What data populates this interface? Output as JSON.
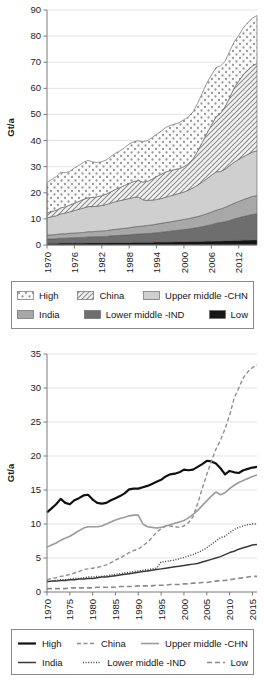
{
  "figure": {
    "panels": [
      {
        "id": "stacked-area-chart",
        "axis": {
          "ylabel": "Gt/a"
        }
      },
      {
        "id": "line-chart",
        "axis": {
          "ylabel": "Gt/a"
        }
      }
    ]
  },
  "legend_top": {
    "rows": [
      [
        {
          "label": "High",
          "pattern": "dots",
          "fill": "#fbfbfb"
        },
        {
          "label": "China",
          "pattern": "diagonal-hatch",
          "fill": "#f2f2f2"
        },
        {
          "label": "Upper middle -CHN",
          "pattern": "solid",
          "fill": "#cfcfcf"
        }
      ],
      [
        {
          "label": "India",
          "pattern": "solid",
          "fill": "#a8a8a8"
        },
        {
          "label": "Lower middle -IND",
          "pattern": "solid",
          "fill": "#6e6e6e"
        },
        {
          "label": "Low",
          "pattern": "solid",
          "fill": "#151515"
        }
      ]
    ]
  },
  "legend_bottom": {
    "rows": [
      [
        {
          "label": "High",
          "stroke": "#111111",
          "width": 2.2,
          "dash": "none"
        },
        {
          "label": "China",
          "stroke": "#8f8f8f",
          "width": 1.4,
          "dash": "4,2.5"
        },
        {
          "label": "Upper middle -CHN",
          "stroke": "#9b9b9b",
          "width": 1.6,
          "dash": "none"
        }
      ],
      [
        {
          "label": "India",
          "stroke": "#3a3a3a",
          "width": 1.5,
          "dash": "none"
        },
        {
          "label": "Lower middle -IND",
          "stroke": "#3f3f3f",
          "width": 1.4,
          "dash": "1,1.6"
        },
        {
          "label": "Low",
          "stroke": "#8a8a8a",
          "width": 1.6,
          "dash": "5,3"
        }
      ]
    ]
  },
  "chart_data": [
    {
      "type": "area",
      "title": "",
      "subtitle": "",
      "stacked": true,
      "xlabel": "",
      "ylabel": "Gt/a",
      "xlim": [
        1970,
        2016
      ],
      "ylim": [
        0,
        90
      ],
      "yticks": [
        0,
        10,
        20,
        30,
        40,
        50,
        60,
        70,
        80,
        90
      ],
      "xticks": [
        1970,
        1976,
        1982,
        1988,
        1994,
        2000,
        2006,
        2012
      ],
      "grid": true,
      "legend_position": "below",
      "x": [
        1970,
        1971,
        1972,
        1973,
        1974,
        1975,
        1976,
        1977,
        1978,
        1979,
        1980,
        1981,
        1982,
        1983,
        1984,
        1985,
        1986,
        1987,
        1988,
        1989,
        1990,
        1991,
        1992,
        1993,
        1994,
        1995,
        1996,
        1997,
        1998,
        1999,
        2000,
        2001,
        2002,
        2003,
        2004,
        2005,
        2006,
        2007,
        2008,
        2009,
        2010,
        2011,
        2012,
        2013,
        2014,
        2015,
        2016
      ],
      "series": [
        {
          "name": "Low",
          "fill": "#151515",
          "pattern": "solid",
          "values": [
            0.7,
            0.7,
            0.7,
            0.8,
            0.8,
            0.8,
            0.8,
            0.8,
            0.8,
            0.9,
            0.9,
            0.9,
            0.9,
            0.9,
            1.0,
            1.0,
            1.0,
            1.0,
            1.0,
            1.1,
            1.1,
            1.1,
            1.1,
            1.1,
            1.2,
            1.2,
            1.2,
            1.2,
            1.3,
            1.3,
            1.3,
            1.3,
            1.4,
            1.4,
            1.4,
            1.5,
            1.5,
            1.6,
            1.6,
            1.7,
            1.7,
            1.8,
            1.8,
            1.9,
            1.9,
            2.0,
            2.0
          ]
        },
        {
          "name": "Lower middle -IND",
          "fill": "#6e6e6e",
          "pattern": "solid",
          "values": [
            1.6,
            1.6,
            1.7,
            1.8,
            1.8,
            1.9,
            2.0,
            2.0,
            2.1,
            2.2,
            2.2,
            2.3,
            2.3,
            2.4,
            2.5,
            2.6,
            2.7,
            2.8,
            2.9,
            3.0,
            3.1,
            3.2,
            3.3,
            3.4,
            3.5,
            3.7,
            3.9,
            4.1,
            4.2,
            4.4,
            4.6,
            4.8,
            5.0,
            5.3,
            5.6,
            5.9,
            6.3,
            6.7,
            7.0,
            7.2,
            7.7,
            8.2,
            8.6,
            9.0,
            9.4,
            9.7,
            9.9
          ]
        },
        {
          "name": "India",
          "fill": "#a8a8a8",
          "pattern": "solid",
          "values": [
            1.5,
            1.6,
            1.6,
            1.7,
            1.7,
            1.8,
            1.8,
            1.9,
            1.9,
            2.0,
            2.0,
            2.1,
            2.2,
            2.2,
            2.3,
            2.4,
            2.5,
            2.6,
            2.7,
            2.8,
            2.9,
            3.0,
            3.1,
            3.2,
            3.3,
            3.4,
            3.5,
            3.6,
            3.7,
            3.8,
            3.9,
            4.0,
            4.1,
            4.2,
            4.4,
            4.6,
            4.8,
            5.0,
            5.2,
            5.5,
            5.8,
            6.0,
            6.3,
            6.5,
            6.7,
            6.9,
            7.0
          ]
        },
        {
          "name": "Upper middle -CHN",
          "fill": "#cfcfcf",
          "pattern": "solid",
          "values": [
            6.6,
            6.9,
            7.2,
            7.6,
            7.9,
            8.2,
            8.6,
            9.0,
            9.4,
            9.6,
            9.6,
            9.6,
            9.7,
            10.0,
            10.3,
            10.6,
            10.8,
            11.0,
            11.2,
            11.3,
            11.3,
            10.0,
            9.6,
            9.5,
            9.4,
            9.5,
            9.7,
            9.9,
            10.1,
            10.3,
            10.5,
            10.9,
            11.4,
            12.0,
            12.7,
            13.4,
            14.1,
            14.7,
            14.3,
            14.6,
            15.2,
            15.7,
            16.1,
            16.4,
            16.7,
            17.0,
            17.2
          ]
        },
        {
          "name": "China",
          "fill": "#f2f2f2",
          "pattern": "diagonal-hatch",
          "values": [
            1.8,
            2.0,
            2.1,
            2.3,
            2.4,
            2.6,
            2.8,
            3.0,
            3.3,
            3.4,
            3.5,
            3.6,
            3.8,
            4.0,
            4.3,
            4.7,
            5.0,
            5.4,
            5.8,
            6.1,
            6.3,
            6.8,
            7.3,
            8.0,
            8.8,
            9.3,
            9.7,
            9.7,
            9.6,
            9.5,
            9.7,
            10.2,
            11.1,
            13.0,
            15.2,
            17.3,
            19.2,
            21.0,
            22.3,
            24.0,
            26.0,
            28.5,
            30.0,
            31.5,
            32.4,
            33.0,
            33.4
          ]
        },
        {
          "name": "High",
          "fill": "#fbfbfb",
          "pattern": "dots",
          "values": [
            11.7,
            12.3,
            12.9,
            13.7,
            13.1,
            12.9,
            13.5,
            13.8,
            14.2,
            14.3,
            13.6,
            13.1,
            13.0,
            13.1,
            13.5,
            13.8,
            14.1,
            14.5,
            15.1,
            15.2,
            15.2,
            15.4,
            15.6,
            15.9,
            16.2,
            16.5,
            17.0,
            17.3,
            17.4,
            17.6,
            18.0,
            17.9,
            18.0,
            18.4,
            18.8,
            19.3,
            19.2,
            18.9,
            18.2,
            17.3,
            17.8,
            17.6,
            17.5,
            17.9,
            18.1,
            18.3,
            18.4
          ]
        }
      ]
    },
    {
      "type": "line",
      "title": "",
      "subtitle": "",
      "xlabel": "",
      "ylabel": "Gt/a",
      "xlim": [
        1970,
        2016
      ],
      "ylim": [
        0,
        35
      ],
      "yticks": [
        0,
        5,
        10,
        15,
        20,
        25,
        30,
        35
      ],
      "xticks": [
        1970,
        1975,
        1980,
        1985,
        1990,
        1995,
        2000,
        2005,
        2010,
        2015
      ],
      "grid": true,
      "legend_position": "below",
      "x": [
        1970,
        1971,
        1972,
        1973,
        1974,
        1975,
        1976,
        1977,
        1978,
        1979,
        1980,
        1981,
        1982,
        1983,
        1984,
        1985,
        1986,
        1987,
        1988,
        1989,
        1990,
        1991,
        1992,
        1993,
        1994,
        1995,
        1996,
        1997,
        1998,
        1999,
        2000,
        2001,
        2002,
        2003,
        2004,
        2005,
        2006,
        2007,
        2008,
        2009,
        2010,
        2011,
        2012,
        2013,
        2014,
        2015,
        2016
      ],
      "series": [
        {
          "name": "High",
          "stroke": "#111111",
          "width": 2.2,
          "dash": "none",
          "values": [
            11.7,
            12.3,
            12.9,
            13.7,
            13.1,
            12.9,
            13.5,
            13.8,
            14.2,
            14.3,
            13.6,
            13.1,
            13.0,
            13.1,
            13.5,
            13.8,
            14.1,
            14.5,
            15.1,
            15.2,
            15.2,
            15.4,
            15.6,
            15.9,
            16.2,
            16.5,
            17.0,
            17.3,
            17.4,
            17.6,
            18.0,
            17.9,
            18.0,
            18.4,
            18.8,
            19.3,
            19.2,
            18.9,
            18.2,
            17.3,
            17.8,
            17.6,
            17.5,
            17.9,
            18.1,
            18.3,
            18.4
          ]
        },
        {
          "name": "China",
          "stroke": "#8f8f8f",
          "width": 1.4,
          "dash": "4,2.5",
          "values": [
            1.8,
            2.0,
            2.1,
            2.3,
            2.4,
            2.6,
            2.8,
            3.0,
            3.3,
            3.4,
            3.5,
            3.6,
            3.8,
            4.0,
            4.3,
            4.7,
            5.0,
            5.4,
            5.8,
            6.1,
            6.3,
            6.8,
            7.3,
            8.0,
            8.8,
            9.3,
            9.7,
            9.7,
            9.6,
            9.5,
            9.7,
            10.2,
            11.1,
            13.0,
            15.2,
            17.3,
            19.2,
            21.0,
            22.3,
            24.0,
            26.0,
            28.5,
            30.0,
            31.5,
            32.4,
            33.0,
            33.4
          ]
        },
        {
          "name": "Upper middle -CHN",
          "stroke": "#9b9b9b",
          "width": 1.6,
          "dash": "none",
          "values": [
            6.6,
            6.9,
            7.2,
            7.6,
            7.9,
            8.2,
            8.6,
            9.0,
            9.4,
            9.6,
            9.6,
            9.6,
            9.7,
            10.0,
            10.3,
            10.6,
            10.8,
            11.0,
            11.2,
            11.3,
            11.3,
            10.0,
            9.6,
            9.5,
            9.4,
            9.5,
            9.7,
            9.9,
            10.1,
            10.3,
            10.5,
            10.9,
            11.4,
            12.0,
            12.7,
            13.4,
            14.1,
            14.7,
            14.3,
            14.6,
            15.2,
            15.7,
            16.1,
            16.4,
            16.7,
            17.0,
            17.2
          ]
        },
        {
          "name": "India",
          "stroke": "#3a3a3a",
          "width": 1.5,
          "dash": "none",
          "values": [
            1.5,
            1.6,
            1.6,
            1.7,
            1.7,
            1.8,
            1.8,
            1.9,
            1.9,
            2.0,
            2.0,
            2.1,
            2.2,
            2.2,
            2.3,
            2.4,
            2.5,
            2.6,
            2.7,
            2.8,
            2.9,
            3.0,
            3.1,
            3.2,
            3.3,
            3.4,
            3.5,
            3.6,
            3.7,
            3.8,
            3.9,
            4.0,
            4.1,
            4.2,
            4.4,
            4.6,
            4.8,
            5.0,
            5.2,
            5.5,
            5.8,
            6.0,
            6.3,
            6.5,
            6.7,
            6.9,
            7.0
          ]
        },
        {
          "name": "Lower middle -IND",
          "stroke": "#3f3f3f",
          "width": 1.4,
          "dash": "1,1.6",
          "values": [
            1.6,
            1.6,
            1.7,
            1.8,
            1.8,
            1.9,
            2.0,
            2.0,
            2.1,
            2.2,
            2.2,
            2.3,
            2.3,
            2.4,
            2.5,
            2.6,
            2.7,
            2.8,
            2.9,
            3.0,
            3.1,
            3.2,
            3.3,
            3.4,
            3.5,
            4.4,
            4.5,
            4.6,
            4.7,
            4.9,
            5.1,
            5.3,
            5.5,
            5.8,
            6.1,
            6.5,
            7.0,
            7.5,
            8.0,
            8.2,
            8.7,
            9.2,
            9.5,
            9.7,
            9.9,
            10.0,
            10.0
          ]
        },
        {
          "name": "Low",
          "stroke": "#8a8a8a",
          "width": 1.6,
          "dash": "5,3",
          "values": [
            0.5,
            0.5,
            0.5,
            0.5,
            0.5,
            0.6,
            0.6,
            0.6,
            0.6,
            0.6,
            0.6,
            0.7,
            0.7,
            0.7,
            0.7,
            0.7,
            0.8,
            0.8,
            0.8,
            0.8,
            0.9,
            0.9,
            0.9,
            0.9,
            1.0,
            1.0,
            1.0,
            1.1,
            1.1,
            1.1,
            1.2,
            1.2,
            1.3,
            1.3,
            1.4,
            1.4,
            1.5,
            1.6,
            1.7,
            1.7,
            1.8,
            1.9,
            2.0,
            2.1,
            2.2,
            2.3,
            2.3
          ]
        }
      ]
    }
  ]
}
